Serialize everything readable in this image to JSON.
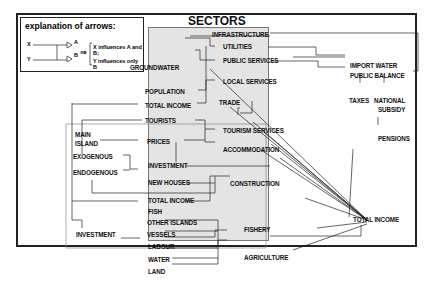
{
  "legend": {
    "title": "explanation of arrows:",
    "x": "X",
    "y": "Y",
    "a": "A",
    "b": "B",
    "line1": "X  influences A and B;",
    "line2": "Y influences only B"
  },
  "sectors": {
    "title": "SECTORS",
    "items": [
      "INFRASTRUCTURE",
      "UTILITIES",
      "PUBLIC SERVICES",
      "LOCAL SERVICES",
      "TRADE",
      "TOURISM SERVICES",
      "ACCOMMODATION",
      "CONSTRUCTION",
      "FISHERY",
      "AGRICULTURE"
    ]
  },
  "inputs": {
    "groundwater": "GROUNDWATER",
    "population": "POPULATION",
    "total_income_1": "TOTAL INCOME",
    "tourists": "TOURISTS",
    "main_island": "MAIN",
    "main_island_2": "ISLAND",
    "prices": "PRICES",
    "exogenous": "EXOGENOUS",
    "endogenous": "ENDOGENOUS",
    "investment": "INVESTMENT",
    "new_houses": "NEW HOUSES",
    "total_income_2": "TOTAL INCOME",
    "fish": "FISH",
    "other_islands": "OTHER ISLANDS",
    "investment_2": "INVESTMENT",
    "vessels": "VESSELS",
    "labour": "LABOUR",
    "water": "WATER",
    "land": "LAND"
  },
  "outputs": {
    "import_water": "IMPORT WATER",
    "public_balance": "PUBLIC BALANCE",
    "taxes": "TAXES",
    "national": "NATIONAL",
    "subsidy": "SUBSIDY",
    "pensions": "PENSIONS",
    "total_income": "TOTAL INCOME"
  }
}
